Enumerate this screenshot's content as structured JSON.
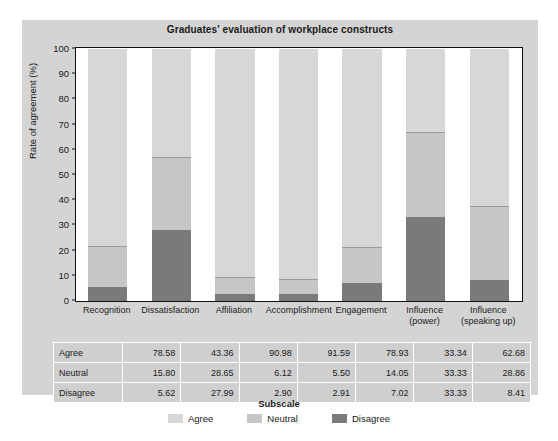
{
  "chart_data": {
    "type": "bar",
    "subtype": "stacked-percentage",
    "title": "Graduates' evaluation of workplace constructs",
    "xlabel": "Subscale",
    "ylabel": "Rate of agreement (%)",
    "ylim": [
      0,
      100
    ],
    "ytick_step": 10,
    "yticks": [
      "100",
      "90",
      "80",
      "70",
      "60",
      "50",
      "40",
      "30",
      "20",
      "10",
      "0"
    ],
    "grid": false,
    "legend_position": "bottom",
    "legend_title": "Subscale",
    "categories": [
      "Recognition",
      "Dissatisfaction",
      "Affiliation",
      "Accomplishment",
      "Engagement",
      "Influence (power)",
      "Influence (speaking up)"
    ],
    "category_lines": [
      [
        "Recognition"
      ],
      [
        "Dissatisfaction"
      ],
      [
        "Affiliation"
      ],
      [
        "Accomplishment"
      ],
      [
        "Engagement"
      ],
      [
        "Influence",
        "(power)"
      ],
      [
        "Influence",
        "(speaking up)"
      ]
    ],
    "series": [
      {
        "name": "Agree",
        "color": "#d7d7d7",
        "values": [
          78.58,
          43.36,
          90.98,
          91.59,
          78.93,
          33.34,
          62.68
        ]
      },
      {
        "name": "Neutral",
        "color": "#c6c6c6",
        "values": [
          15.8,
          28.65,
          6.12,
          5.5,
          14.05,
          33.33,
          28.86
        ]
      },
      {
        "name": "Disagree",
        "color": "#7a7a7a",
        "values": [
          5.62,
          27.99,
          2.9,
          2.91,
          7.02,
          33.33,
          8.41
        ]
      }
    ],
    "stack_order_bottom_to_top": [
      "Disagree",
      "Neutral",
      "Agree"
    ]
  },
  "table": {
    "row_labels": [
      "Agree",
      "Neutral",
      "Disagree"
    ],
    "rows": [
      [
        "78.58",
        "43.36",
        "90.98",
        "91.59",
        "78.93",
        "33.34",
        "62.68"
      ],
      [
        "15.80",
        "28.65",
        "6.12",
        "5.50",
        "14.05",
        "33.33",
        "28.86"
      ],
      [
        "5.62",
        "27.99",
        "2.90",
        "2.91",
        "7.02",
        "33.33",
        "8.41"
      ]
    ]
  },
  "legend": {
    "title": "Subscale",
    "items": [
      {
        "label": "Agree",
        "color": "#d7d7d7"
      },
      {
        "label": "Neutral",
        "color": "#c6c6c6"
      },
      {
        "label": "Disagree",
        "color": "#7a7a7a"
      }
    ]
  },
  "colors": {
    "panel_background": "#d4d4d4",
    "plot_background": "#ffffff",
    "axis": "#111111",
    "text": "#1a1a1a",
    "table_cell": "#cfcfcf"
  }
}
